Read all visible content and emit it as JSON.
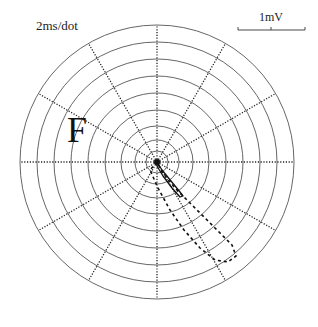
{
  "labels": {
    "time_scale": "2ms/dot",
    "voltage_scale": "1mV",
    "lead": "F"
  },
  "polar_grid": {
    "center": [
      157,
      162
    ],
    "ring_radii": [
      11,
      22,
      36,
      52,
      69,
      86,
      103,
      120,
      137
    ],
    "spoke_count": 12,
    "spoke_angle_step_deg": 30,
    "ring_color": "#555555",
    "spoke_color": "#222222",
    "spoke_style": "dotted"
  },
  "scale_bar": {
    "x1": 238,
    "x2": 305,
    "y": 30,
    "tick_mid": 271
  },
  "loops": [
    {
      "name": "QRS-loop",
      "style": "dashed",
      "color": "#111111",
      "points": [
        [
          157,
          162
        ],
        [
          150,
          170
        ],
        [
          158,
          188
        ],
        [
          170,
          210
        ],
        [
          184,
          230
        ],
        [
          200,
          248
        ],
        [
          215,
          260
        ],
        [
          228,
          262
        ],
        [
          236,
          256
        ],
        [
          232,
          245
        ],
        [
          215,
          228
        ],
        [
          195,
          208
        ],
        [
          175,
          188
        ],
        [
          162,
          172
        ],
        [
          157,
          162
        ]
      ]
    },
    {
      "name": "T-loop",
      "style": "solid",
      "color": "#111111",
      "points": [
        [
          157,
          162
        ],
        [
          162,
          170
        ],
        [
          171,
          181
        ],
        [
          180,
          192
        ],
        [
          183,
          196
        ],
        [
          180,
          197
        ],
        [
          172,
          188
        ],
        [
          163,
          176
        ],
        [
          157,
          166
        ],
        [
          157,
          162
        ]
      ]
    }
  ]
}
